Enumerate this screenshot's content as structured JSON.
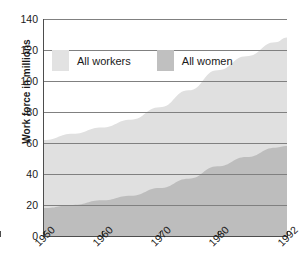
{
  "chart_data": {
    "type": "area",
    "title": "",
    "subtitle": "",
    "xlabel": "",
    "ylabel": "Work force in millions",
    "x": [
      1950,
      1955,
      1960,
      1965,
      1970,
      1975,
      1980,
      1985,
      1990,
      1992
    ],
    "xlim": [
      1950,
      1992
    ],
    "ylim": [
      0,
      140
    ],
    "xticks": [
      1950,
      1960,
      1970,
      1980,
      1992
    ],
    "xtick_labels": [
      "1950",
      "1960",
      "1970",
      "1980",
      "1992"
    ],
    "yticks": [
      0,
      20,
      40,
      60,
      80,
      100,
      120,
      140
    ],
    "ytick_labels": [
      "0",
      "20",
      "40",
      "60",
      "80",
      "100",
      "120",
      "140"
    ],
    "grid": true,
    "grid_axis": "y",
    "legend_position": "upper-left-inside",
    "series": [
      {
        "name": "All workers",
        "color": "#e0e0e0",
        "values": [
          62,
          66,
          70,
          75,
          83,
          94,
          107,
          116,
          125,
          128
        ]
      },
      {
        "name": "All women",
        "color": "#bdbdbd",
        "values": [
          18,
          20,
          23,
          26,
          31,
          37,
          45,
          51,
          57,
          58
        ]
      }
    ],
    "annotations": []
  },
  "legend": {
    "entries": [
      {
        "label": "All workers",
        "swatch_color": "#e2e2e2"
      },
      {
        "label": "All women",
        "swatch_color": "#c0c0c0"
      }
    ]
  },
  "axes": {
    "y_title": "Work force in millions",
    "y_labels": [
      "140",
      "120",
      "100",
      "80",
      "60",
      "40",
      "20",
      "0"
    ],
    "x_labels": [
      "1950",
      "1960",
      "1970",
      "1980",
      "1992"
    ]
  },
  "colors": {
    "background": "#ffffff",
    "axis": "#4d4d4d",
    "gridline": "#808080",
    "workers_fill": "#e0e0e0",
    "women_fill": "#bdbdbd",
    "text": "#1a1a1a"
  }
}
